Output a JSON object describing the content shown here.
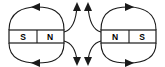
{
  "diagram": {
    "background_color": "#ffffff",
    "line_color": "#1a1a1a",
    "label_color": "#000000",
    "width": 165,
    "height": 67
  },
  "magnets": [
    {
      "id": "left-magnet",
      "left_pole": "S",
      "right_pole": "N",
      "x": 9,
      "y": 30,
      "width": 55,
      "height": 13,
      "left_label_x": 23,
      "right_label_x": 50,
      "label_y": 36.5,
      "divider_x": 37
    },
    {
      "id": "right-magnet",
      "left_pole": "N",
      "right_pole": "S",
      "x": 101,
      "y": 30,
      "width": 55,
      "height": 13,
      "left_label_x": 115,
      "right_label_x": 142,
      "label_y": 36.5,
      "divider_x": 129
    }
  ],
  "field_lines": {
    "left_loop_top": {
      "name": "left-magnet-upper-loop",
      "path": "M 64 30 C 64 10 50 7 37 7 C 23 7 9 12 9 30",
      "arrow_at": "top-center",
      "arrow_direction": "left",
      "arrow_x": 35,
      "arrow_y": 7
    },
    "left_loop_bottom": {
      "name": "left-magnet-lower-loop",
      "path": "M 64 43 C 64 61 50 63 37 63 C 23 63 9 59 9 43",
      "arrow_at": "bottom-center",
      "arrow_direction": "left",
      "arrow_x": 35,
      "arrow_y": 63
    },
    "left_outer_upper": {
      "name": "left-magnet-outer-upper-line",
      "path": "M 64 32 C 72 30 76 22 77 6",
      "arrow_direction": "up",
      "arrow_x": 77,
      "arrow_y": 5
    },
    "left_outer_lower": {
      "name": "left-magnet-outer-lower-line",
      "path": "M 64 41 C 72 43 76 51 77 61",
      "arrow_direction": "down",
      "arrow_x": 77,
      "arrow_y": 63
    },
    "right_loop_top": {
      "name": "right-magnet-upper-loop",
      "path": "M 101 30 C 101 10 115 7 128 7 C 142 7 156 12 156 30",
      "arrow_at": "top-center",
      "arrow_direction": "right",
      "arrow_x": 130,
      "arrow_y": 7
    },
    "right_loop_bottom": {
      "name": "right-magnet-lower-loop",
      "path": "M 101 43 C 101 61 115 63 128 63 C 142 63 156 59 156 43",
      "arrow_at": "bottom-center",
      "arrow_direction": "right",
      "arrow_x": 130,
      "arrow_y": 63
    },
    "right_outer_upper": {
      "name": "right-magnet-outer-upper-line",
      "path": "M 101 32 C 93 30 89 22 88 6",
      "arrow_direction": "up",
      "arrow_x": 88,
      "arrow_y": 5
    },
    "right_outer_lower": {
      "name": "right-magnet-outer-lower-line",
      "path": "M 101 41 C 93 43 89 51 88 61",
      "arrow_direction": "down",
      "arrow_x": 88,
      "arrow_y": 63
    }
  }
}
